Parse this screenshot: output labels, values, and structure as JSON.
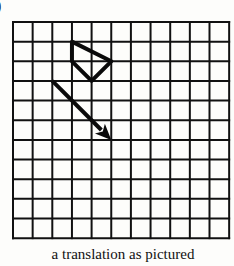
{
  "part_label": ")",
  "caption": "a translation as pictured",
  "grid": {
    "columns": 11,
    "rows": 11,
    "origin_px": [
      13,
      22
    ],
    "cell_px": 19.65,
    "line_color": "#111111"
  },
  "shape": {
    "name": "quadrilateral",
    "vertices_grid": [
      [
        3,
        1
      ],
      [
        5,
        2
      ],
      [
        4,
        3
      ],
      [
        3,
        2
      ]
    ],
    "stroke_color": "#0a0a0a"
  },
  "arrow": {
    "name": "translation-vector",
    "from_grid": [
      2,
      3
    ],
    "to_grid": [
      5,
      6
    ],
    "stroke_color": "#0a0a0a"
  }
}
